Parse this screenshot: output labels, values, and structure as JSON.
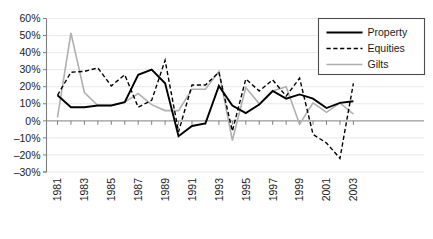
{
  "chart_data": {
    "type": "line",
    "title": "",
    "xlabel": "",
    "ylabel": "",
    "ylim": [
      -30,
      60
    ],
    "ytick_step": 10,
    "ytick_labels": [
      "60%",
      "50%",
      "40%",
      "30%",
      "20%",
      "10%",
      "0%",
      "-10%",
      "-20%",
      "-30%"
    ],
    "ytick_values": [
      60,
      50,
      40,
      30,
      20,
      10,
      0,
      -10,
      -20,
      -30
    ],
    "grid": true,
    "legend_position": "top-right",
    "x": [
      1981,
      1982,
      1983,
      1984,
      1985,
      1986,
      1987,
      1988,
      1989,
      1990,
      1991,
      1992,
      1993,
      1994,
      1995,
      1996,
      1997,
      1998,
      1999,
      2000,
      2001,
      2002,
      2003
    ],
    "xtick_labels": [
      "1981",
      "1983",
      "1985",
      "1987",
      "1989",
      "1991",
      "1993",
      "1995",
      "1997",
      "1999",
      "2001",
      "2003"
    ],
    "xtick_values": [
      1981,
      1983,
      1985,
      1987,
      1989,
      1991,
      1993,
      1995,
      1997,
      1999,
      2001,
      2003
    ],
    "series": [
      {
        "name": "Property",
        "style": "solid",
        "color": "#000000",
        "values": [
          15,
          8,
          8,
          9,
          9,
          11,
          27,
          30,
          22,
          -9,
          -3,
          -1.5,
          20.5,
          9,
          4.5,
          9.5,
          17.5,
          13,
          15.5,
          13,
          7.5,
          10.5,
          11.5
        ]
      },
      {
        "name": "Equities",
        "style": "dashed",
        "color": "#000000",
        "values": [
          15,
          28.5,
          29,
          31,
          20.5,
          27,
          8,
          12,
          35.5,
          -6.5,
          21,
          21,
          28.5,
          -6,
          24.5,
          17.5,
          24,
          14.5,
          25,
          -8,
          -13,
          -22,
          22
        ]
      },
      {
        "name": "Gilts",
        "style": "solid",
        "color": "#b0b0b0",
        "values": [
          2,
          51.5,
          16.5,
          9,
          9,
          11,
          16,
          9.5,
          6,
          6,
          18.5,
          18.5,
          29,
          -11.5,
          19.5,
          10,
          17.5,
          20,
          -2,
          10.5,
          5,
          10.5,
          4
        ]
      }
    ]
  },
  "legend": {
    "items": [
      {
        "label": "Property"
      },
      {
        "label": "Equities"
      },
      {
        "label": "Gilts"
      }
    ]
  }
}
